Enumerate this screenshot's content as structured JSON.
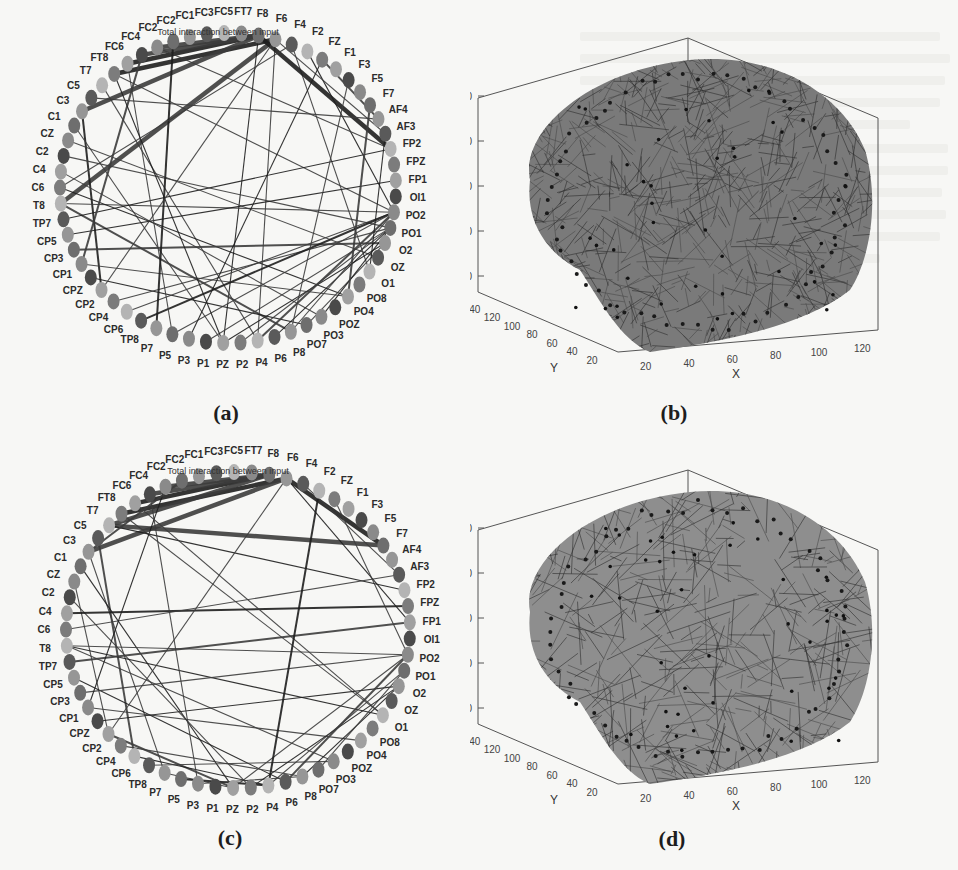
{
  "figure": {
    "panels": [
      {
        "id": "a",
        "caption": "(a)",
        "type": "circular-connectivity-graph",
        "title": "Total interaction between input"
      },
      {
        "id": "b",
        "caption": "(b)",
        "type": "3d-brain-network",
        "axes": {
          "x_label": "X",
          "y_label": "Y",
          "z_label": ""
        }
      },
      {
        "id": "c",
        "caption": "(c)",
        "type": "circular-connectivity-graph",
        "title": "Total interaction between input"
      },
      {
        "id": "d",
        "caption": "(d)",
        "type": "3d-brain-network",
        "axes": {
          "x_label": "X",
          "y_label": "Y",
          "z_label": "Z"
        }
      }
    ],
    "channels": [
      "FT7",
      "F8",
      "F6",
      "F4",
      "F2",
      "FZ",
      "F1",
      "F3",
      "F5",
      "F7",
      "AF4",
      "AF3",
      "FP2",
      "FPZ",
      "FP1",
      "OI1",
      "PO2",
      "PO1",
      "O2",
      "OZ",
      "O1",
      "PO8",
      "PO4",
      "POZ",
      "PO3",
      "PO7",
      "P8",
      "P6",
      "P4",
      "P2",
      "PZ",
      "P1",
      "P3",
      "P5",
      "P7",
      "TP8",
      "CP6",
      "CP4",
      "CP2",
      "CPZ",
      "CP1",
      "CP3",
      "CP5",
      "TP7",
      "T8",
      "C6",
      "C4",
      "C2",
      "CZ",
      "C1",
      "C3",
      "C5",
      "T7",
      "FT8",
      "FC6",
      "FC4",
      "FC2",
      "FC2",
      "FC1",
      "FC3",
      "FC5"
    ],
    "node_colors": [
      "#8a8a8a",
      "#5a5a5a",
      "#a0a0a0",
      "#6e6e6e",
      "#b4b4b4",
      "#4a4a4a",
      "#969696",
      "#7c7c7c"
    ],
    "edges_a": [
      [
        1,
        54
      ],
      [
        1,
        55
      ],
      [
        1,
        56
      ],
      [
        2,
        53
      ],
      [
        1,
        50
      ],
      [
        2,
        44
      ],
      [
        1,
        30
      ],
      [
        2,
        28
      ],
      [
        3,
        20
      ],
      [
        4,
        16
      ],
      [
        5,
        10
      ],
      [
        2,
        11
      ],
      [
        1,
        12
      ],
      [
        53,
        16
      ],
      [
        52,
        28
      ],
      [
        50,
        38
      ],
      [
        49,
        30
      ],
      [
        44,
        16
      ],
      [
        45,
        22
      ],
      [
        46,
        24
      ],
      [
        44,
        26
      ],
      [
        43,
        12
      ],
      [
        47,
        17
      ],
      [
        48,
        19
      ],
      [
        42,
        14
      ],
      [
        41,
        18
      ],
      [
        40,
        22
      ],
      [
        39,
        25
      ],
      [
        36,
        16
      ],
      [
        37,
        17
      ],
      [
        35,
        16
      ],
      [
        33,
        16
      ],
      [
        31,
        17
      ],
      [
        30,
        18
      ],
      [
        29,
        17
      ],
      [
        28,
        16
      ],
      [
        27,
        17
      ],
      [
        26,
        16
      ],
      [
        25,
        18
      ],
      [
        24,
        17
      ],
      [
        55,
        40
      ],
      [
        54,
        33
      ],
      [
        53,
        30
      ],
      [
        51,
        10
      ],
      [
        56,
        12
      ],
      [
        57,
        34
      ],
      [
        3,
        45
      ],
      [
        2,
        38
      ],
      [
        5,
        32
      ],
      [
        7,
        26
      ],
      [
        9,
        22
      ],
      [
        11,
        20
      ]
    ],
    "edges_c": [
      [
        1,
        54
      ],
      [
        1,
        55
      ],
      [
        1,
        56
      ],
      [
        2,
        53
      ],
      [
        1,
        52
      ],
      [
        2,
        50
      ],
      [
        2,
        9
      ],
      [
        52,
        9
      ],
      [
        53,
        20
      ],
      [
        52,
        12
      ],
      [
        51,
        36
      ],
      [
        50,
        34
      ],
      [
        49,
        30
      ],
      [
        48,
        38
      ],
      [
        47,
        29
      ],
      [
        46,
        13
      ],
      [
        45,
        11
      ],
      [
        44,
        16
      ],
      [
        44,
        20
      ],
      [
        44,
        24
      ],
      [
        43,
        14
      ],
      [
        42,
        27
      ],
      [
        41,
        16
      ],
      [
        40,
        22
      ],
      [
        39,
        18
      ],
      [
        38,
        30
      ],
      [
        37,
        26
      ],
      [
        36,
        28
      ],
      [
        35,
        24
      ],
      [
        34,
        30
      ],
      [
        33,
        28
      ],
      [
        32,
        26
      ],
      [
        30,
        16
      ],
      [
        29,
        18
      ],
      [
        28,
        17
      ],
      [
        27,
        16
      ],
      [
        26,
        18
      ],
      [
        25,
        17
      ],
      [
        55,
        32
      ],
      [
        56,
        40
      ],
      [
        57,
        50
      ],
      [
        54,
        20
      ],
      [
        2,
        14
      ],
      [
        3,
        11
      ],
      [
        2,
        38
      ],
      [
        4,
        28
      ],
      [
        5,
        16
      ]
    ],
    "axis_ticks_b": {
      "z": [
        "20",
        "40",
        "60",
        "80",
        "100"
      ],
      "y": [
        "20",
        "40",
        "60",
        "80",
        "100",
        "120",
        "140"
      ],
      "x": [
        "20",
        "40",
        "60",
        "80",
        "100",
        "120"
      ]
    },
    "axis_ticks_d": {
      "z": [
        "20",
        "40",
        "60",
        "80",
        "100"
      ],
      "y": [
        "20",
        "40",
        "60",
        "80",
        "100",
        "120",
        "140"
      ],
      "x": [
        "20",
        "40",
        "60",
        "80",
        "100",
        "120"
      ]
    }
  },
  "chart_data": [
    {
      "type": "circular-graph",
      "panel": "a",
      "title": "Total interaction between input",
      "nodes": [
        "FT7",
        "F8",
        "F6",
        "F4",
        "F2",
        "FZ",
        "F1",
        "F3",
        "F5",
        "F7",
        "AF4",
        "AF3",
        "FP2",
        "FPZ",
        "FP1",
        "OI1",
        "PO2",
        "PO1",
        "O2",
        "OZ",
        "O1",
        "PO8",
        "PO4",
        "POZ",
        "PO3",
        "PO7",
        "P8",
        "P6",
        "P4",
        "P2",
        "PZ",
        "P1",
        "P3",
        "P5",
        "P7",
        "TP8",
        "CP6",
        "CP4",
        "CP2",
        "CPZ",
        "CP1",
        "CP3",
        "CP5",
        "TP7",
        "T8",
        "C6",
        "C4",
        "C2",
        "CZ",
        "C1",
        "C3",
        "C5",
        "T7",
        "FT8",
        "FC6",
        "FC4",
        "FC2",
        "FC2",
        "FC1",
        "FC3",
        "FC5"
      ]
    },
    {
      "type": "scatter3d-network",
      "panel": "b",
      "xlabel": "X",
      "ylabel": "Y",
      "zlabel": "",
      "xlim": [
        0,
        130
      ],
      "ylim": [
        0,
        150
      ],
      "zlim": [
        0,
        110
      ],
      "xticks": [
        20,
        40,
        60,
        80,
        100,
        120
      ],
      "yticks": [
        20,
        40,
        60,
        80,
        100,
        120,
        140
      ],
      "zticks": [
        20,
        40,
        60,
        80,
        100
      ]
    },
    {
      "type": "circular-graph",
      "panel": "c",
      "title": "Total interaction between input",
      "nodes": [
        "FT7",
        "F8",
        "F6",
        "F4",
        "F2",
        "FZ",
        "F1",
        "F3",
        "F5",
        "F7",
        "AF4",
        "AF3",
        "FP2",
        "FPZ",
        "FP1",
        "OI1",
        "PO2",
        "PO1",
        "O2",
        "OZ",
        "O1",
        "PO8",
        "PO4",
        "POZ",
        "PO3",
        "PO7",
        "P8",
        "P6",
        "P4",
        "P2",
        "PZ",
        "P1",
        "P3",
        "P5",
        "P7",
        "TP8",
        "CP6",
        "CP4",
        "CP2",
        "CPZ",
        "CP1",
        "CP3",
        "CP5",
        "TP7",
        "T8",
        "C6",
        "C4",
        "C2",
        "CZ",
        "C1",
        "C3",
        "C5",
        "T7",
        "FT8",
        "FC6",
        "FC4",
        "FC2",
        "FC2",
        "FC1",
        "FC3",
        "FC5"
      ]
    },
    {
      "type": "scatter3d-network",
      "panel": "d",
      "xlabel": "X",
      "ylabel": "Y",
      "zlabel": "Z",
      "xlim": [
        0,
        130
      ],
      "ylim": [
        0,
        150
      ],
      "zlim": [
        0,
        110
      ],
      "xticks": [
        20,
        40,
        60,
        80,
        100,
        120
      ],
      "yticks": [
        20,
        40,
        60,
        80,
        100,
        120,
        140
      ],
      "zticks": [
        20,
        40,
        60,
        80,
        100
      ]
    }
  ]
}
